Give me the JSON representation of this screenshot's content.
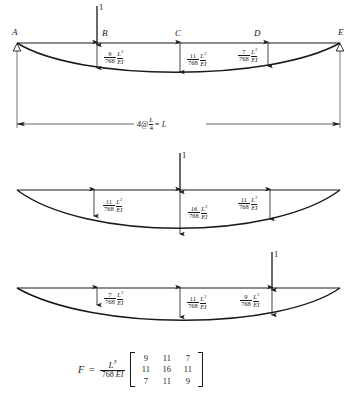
{
  "figure": {
    "beam": {
      "points": [
        {
          "label": "A",
          "x": 17
        },
        {
          "label": "B",
          "x": 97
        },
        {
          "label": "C",
          "x": 180
        },
        {
          "label": "D",
          "x": 258
        },
        {
          "label": "E",
          "x": 340
        }
      ],
      "span_dimension": {
        "prefix": "4@",
        "fraction_num": "L",
        "fraction_den": "4",
        "suffix": "= L"
      },
      "support_type": "pin-roller-triangle"
    },
    "diagrams": [
      {
        "id": "diagram-1",
        "load_label": "1",
        "load_at": "B",
        "load_x": 97,
        "deflections": [
          {
            "at": "B",
            "x": 97,
            "num": "9",
            "den": "768",
            "sym_num": "L",
            "sym_exp": "3",
            "sym_den": "EI"
          },
          {
            "at": "C",
            "x": 180,
            "num": "11",
            "den": "768",
            "sym_num": "L",
            "sym_exp": "3",
            "sym_den": "EI"
          },
          {
            "at": "D",
            "x": 258,
            "num": "7",
            "den": "768",
            "sym_num": "L",
            "sym_exp": "3",
            "sym_den": "EI"
          }
        ]
      },
      {
        "id": "diagram-2",
        "load_label": "1",
        "load_at": "C",
        "load_x": 180,
        "deflections": [
          {
            "at": "B",
            "x": 97,
            "num": "11",
            "den": "768",
            "sym_num": "L",
            "sym_exp": "3",
            "sym_den": "EI"
          },
          {
            "at": "C",
            "x": 180,
            "num": "16",
            "den": "768",
            "sym_num": "L",
            "sym_exp": "3",
            "sym_den": "EI"
          },
          {
            "at": "D",
            "x": 258,
            "num": "11",
            "den": "768",
            "sym_num": "L",
            "sym_exp": "3",
            "sym_den": "EI"
          }
        ]
      },
      {
        "id": "diagram-3",
        "load_label": "1",
        "load_at": "D",
        "load_x": 258,
        "deflections": [
          {
            "at": "B",
            "x": 97,
            "num": "7",
            "den": "768",
            "sym_num": "L",
            "sym_exp": "3",
            "sym_den": "EI"
          },
          {
            "at": "C",
            "x": 180,
            "num": "11",
            "den": "768",
            "sym_num": "L",
            "sym_exp": "3",
            "sym_den": "EI"
          },
          {
            "at": "D",
            "x": 258,
            "num": "9",
            "den": "768",
            "sym_num": "L",
            "sym_exp": "3",
            "sym_den": "EI"
          }
        ]
      }
    ],
    "matrix_equation": {
      "symbol": "F",
      "equals": "=",
      "scalar_num": "L",
      "scalar_exp": "3",
      "scalar_den_number": "768",
      "scalar_den_sym": "EI",
      "rows": [
        [
          "9",
          "11",
          "7"
        ],
        [
          "11",
          "16",
          "11"
        ],
        [
          "7",
          "11",
          "9"
        ]
      ]
    }
  },
  "colors": {
    "ink": "#1a1a1a",
    "background": "#ffffff"
  }
}
